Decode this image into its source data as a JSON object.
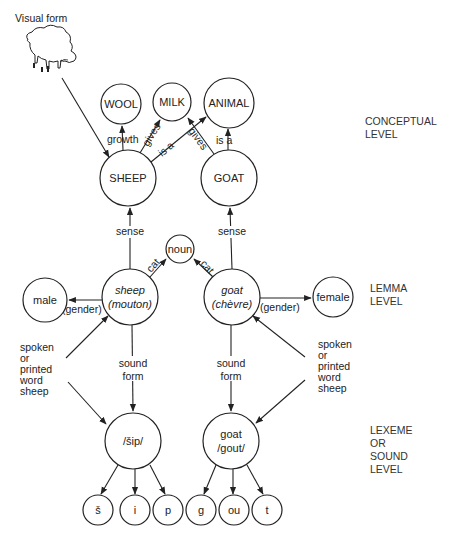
{
  "visual_form": {
    "label": "Visual form",
    "icon": "sheep-drawing-icon"
  },
  "levels": {
    "conceptual": [
      "CONCEPTUAL",
      "LEVEL"
    ],
    "lemma": [
      "LEMMA",
      "LEVEL"
    ],
    "lexeme": [
      "LEXEME",
      "OR",
      "SOUND",
      "LEVEL"
    ]
  },
  "conceptual_nodes": {
    "wool": "WOOL",
    "milk": "MILK",
    "animal": "ANIMAL",
    "sheep": "SHEEP",
    "goat": "GOAT"
  },
  "conceptual_edges": {
    "growth": "growth",
    "sheep_gives": "gives",
    "sheep_is_a": "is a",
    "goat_gives": "gives",
    "goat_is_a": "is a"
  },
  "lemma_nodes": {
    "noun": "noun",
    "male": "male",
    "female": "female",
    "sheep_lemma": [
      "sheep",
      "(mouton)"
    ],
    "goat_lemma": [
      "goat",
      "(chèvre)"
    ]
  },
  "lemma_edges": {
    "sense": "sense",
    "cat": "cat",
    "gender": "(gender)"
  },
  "input_label": [
    "spoken",
    "or",
    "printed",
    "word",
    "sheep"
  ],
  "sound_form_label": [
    "sound",
    "form"
  ],
  "lexeme_nodes": {
    "sheep_lexeme": "/šip/",
    "goat_lexeme": [
      "goat",
      "/gout/"
    ]
  },
  "phonemes": {
    "sheep": [
      "š",
      "i",
      "p"
    ],
    "goat": [
      "g",
      "ou",
      "t"
    ]
  }
}
